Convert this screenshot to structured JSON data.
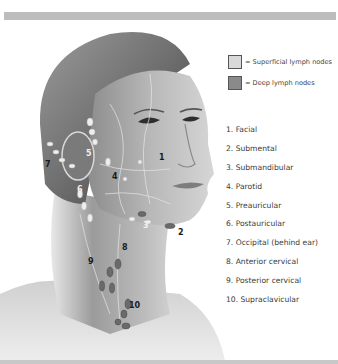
{
  "figure": {
    "colors": {
      "top_bar": "#bdbdbd",
      "bottom_bar": "#c8c8c8",
      "superficial_swatch": "#d9d9d9",
      "deep_swatch": "#8a8a8a",
      "text": "#3a3a3a"
    }
  },
  "legend": {
    "items": [
      {
        "label": "= Superficial lymph nodes",
        "swatch": "#d9d9d9"
      },
      {
        "label": "= Deep lymph nodes",
        "swatch": "#8a8a8a"
      }
    ]
  },
  "node_list": {
    "items": [
      {
        "number": 1,
        "label": "1. Facial"
      },
      {
        "number": 2,
        "label": "2. Submental"
      },
      {
        "number": 3,
        "label": "3. Submandibular"
      },
      {
        "number": 4,
        "label": "4. Parotid"
      },
      {
        "number": 5,
        "label": "5. Preauricular"
      },
      {
        "number": 6,
        "label": "6. Postauricular"
      },
      {
        "number": 7,
        "label": "7. Occipital (behind ear)"
      },
      {
        "number": 8,
        "label": "8. Anterior cervical"
      },
      {
        "number": 9,
        "label": "9. Posterior cervical"
      },
      {
        "number": 10,
        "label": "10. Supraclavicular"
      }
    ]
  },
  "diagram_labels": {
    "l1": "1",
    "l2": "2",
    "l3": "3",
    "l4": "4",
    "l5": "5",
    "l6": "6",
    "l7": "7",
    "l8": "8",
    "l9": "9",
    "l10": "10"
  }
}
